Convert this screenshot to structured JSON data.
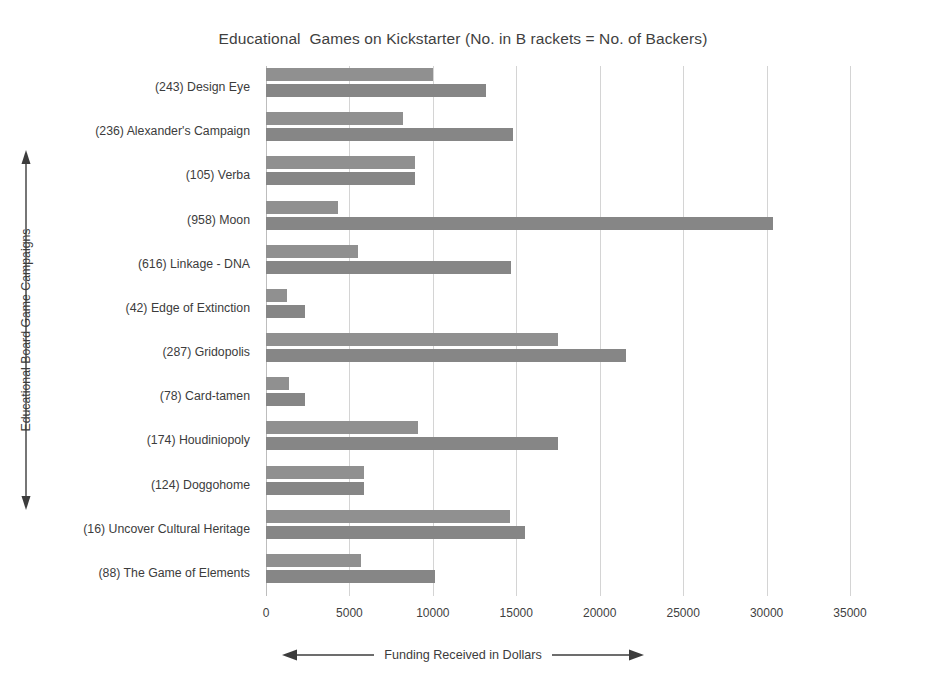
{
  "chart_data": {
    "type": "bar",
    "orientation": "horizontal",
    "title": "Educational  Games on Kickstarter (No. in B rackets = No. of Backers)",
    "xlabel": "Funding Received in Dollars",
    "ylabel": "Educational Board Game Campaigns",
    "xlim": [
      0,
      35000
    ],
    "xticks": [
      0,
      5000,
      10000,
      15000,
      20000,
      25000,
      30000,
      35000
    ],
    "xtick_labels": [
      "0",
      "5000",
      "10000",
      "15000",
      "20000",
      "25000",
      "30000",
      "35000"
    ],
    "grid": "vertical",
    "legend": "none",
    "bar_color": "#8b8b8b",
    "categories": [
      "(243) Design Eye",
      "(236) Alexander's Campaign",
      "(105) Verba",
      "(958) Moon",
      "(616) Linkage - DNA",
      "(42) Edge of Extinction",
      "(287) Gridopolis",
      "(78) Card-tamen",
      "(174) Houdiniopoly",
      "(124) Doggohome",
      "(16) Uncover Cultural Heritage",
      "(88) The Game of Elements"
    ],
    "series": [
      {
        "name": "Goal",
        "values": [
          10000,
          8200,
          8900,
          4300,
          5500,
          1250,
          17500,
          1400,
          9100,
          5900,
          14600,
          5700
        ]
      },
      {
        "name": "Pledged",
        "values": [
          13200,
          14800,
          8900,
          30400,
          14700,
          2350,
          21600,
          2350,
          17500,
          5900,
          15500,
          10100
        ]
      }
    ]
  }
}
